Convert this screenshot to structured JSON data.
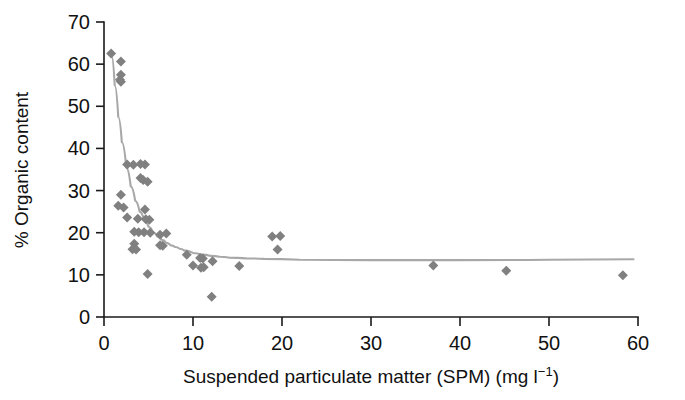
{
  "figure": {
    "background": "#ffffff",
    "marker_color": "#808080",
    "curve_color": "#a8a8a8",
    "axis_color": "#1a1a1a"
  },
  "chart_data": {
    "type": "scatter",
    "title": "",
    "xlabel_parts": {
      "main": "Suspended particulate matter (SPM) (mg l",
      "superscript": "−1",
      "tail": ")"
    },
    "xlabel": "Suspended particulate matter (SPM) (mg l−1)",
    "ylabel": "% Organic content",
    "xlim": [
      0,
      60
    ],
    "ylim": [
      0,
      70
    ],
    "xticks": [
      0,
      10,
      20,
      30,
      40,
      50,
      60
    ],
    "xtick_labels": [
      "0",
      "10",
      "20",
      "30",
      "40",
      "50",
      "60"
    ],
    "yticks": [
      0,
      10,
      20,
      30,
      40,
      50,
      60,
      70
    ],
    "ytick_labels": [
      "0",
      "10",
      "20",
      "30",
      "40",
      "50",
      "60",
      "70"
    ],
    "grid": false,
    "legend": null,
    "marker_shape": "diamond",
    "points": [
      [
        0.8,
        62.5
      ],
      [
        1.9,
        60.6
      ],
      [
        1.9,
        57.5
      ],
      [
        1.8,
        56.3
      ],
      [
        1.9,
        55.8
      ],
      [
        2.6,
        36.2
      ],
      [
        3.3,
        36.1
      ],
      [
        4.1,
        36.3
      ],
      [
        4.6,
        36.2
      ],
      [
        4.1,
        33.0
      ],
      [
        4.4,
        32.5
      ],
      [
        4.9,
        32.1
      ],
      [
        1.9,
        29.0
      ],
      [
        1.6,
        26.4
      ],
      [
        2.2,
        26.0
      ],
      [
        4.6,
        25.5
      ],
      [
        2.6,
        23.6
      ],
      [
        3.8,
        23.3
      ],
      [
        4.7,
        23.2
      ],
      [
        5.1,
        23.1
      ],
      [
        3.4,
        20.2
      ],
      [
        3.9,
        20.1
      ],
      [
        4.5,
        20.1
      ],
      [
        5.2,
        20.0
      ],
      [
        6.3,
        19.5
      ],
      [
        7.0,
        19.8
      ],
      [
        3.4,
        17.4
      ],
      [
        3.2,
        16.1
      ],
      [
        3.6,
        16.0
      ],
      [
        6.3,
        17.0
      ],
      [
        6.6,
        16.9
      ],
      [
        4.9,
        10.2
      ],
      [
        9.3,
        14.8
      ],
      [
        10.8,
        14.0
      ],
      [
        11.1,
        13.9
      ],
      [
        12.2,
        13.2
      ],
      [
        10.0,
        12.2
      ],
      [
        10.9,
        11.7
      ],
      [
        11.2,
        11.8
      ],
      [
        12.1,
        4.8
      ],
      [
        15.2,
        12.1
      ],
      [
        18.9,
        19.1
      ],
      [
        19.8,
        19.2
      ],
      [
        19.5,
        16.0
      ],
      [
        37.0,
        12.2
      ],
      [
        45.2,
        11.0
      ],
      [
        58.3,
        9.9
      ]
    ],
    "fit_curve": {
      "description": "decaying exponential fit approaching asymptote ~13.6",
      "asymptote": 13.6,
      "points": [
        [
          0.85,
          62.0
        ],
        [
          1.2,
          55.0
        ],
        [
          1.6,
          47.5
        ],
        [
          2.0,
          41.5
        ],
        [
          2.5,
          35.5
        ],
        [
          3.0,
          31.0
        ],
        [
          3.5,
          27.6
        ],
        [
          4.0,
          25.0
        ],
        [
          4.5,
          23.0
        ],
        [
          5.0,
          21.4
        ],
        [
          5.5,
          20.1
        ],
        [
          6.0,
          19.1
        ],
        [
          6.5,
          18.3
        ],
        [
          7.0,
          17.6
        ],
        [
          7.5,
          17.0
        ],
        [
          8.0,
          16.6
        ],
        [
          8.5,
          16.2
        ],
        [
          9.0,
          15.8
        ],
        [
          10.0,
          15.2
        ],
        [
          11.0,
          14.8
        ],
        [
          12.0,
          14.5
        ],
        [
          13.0,
          14.3
        ],
        [
          14.0,
          14.1
        ],
        [
          16.0,
          13.9
        ],
        [
          18.0,
          13.8
        ],
        [
          22.0,
          13.6
        ],
        [
          30.0,
          13.5
        ],
        [
          40.0,
          13.5
        ],
        [
          50.0,
          13.6
        ],
        [
          59.5,
          13.7
        ]
      ]
    }
  }
}
